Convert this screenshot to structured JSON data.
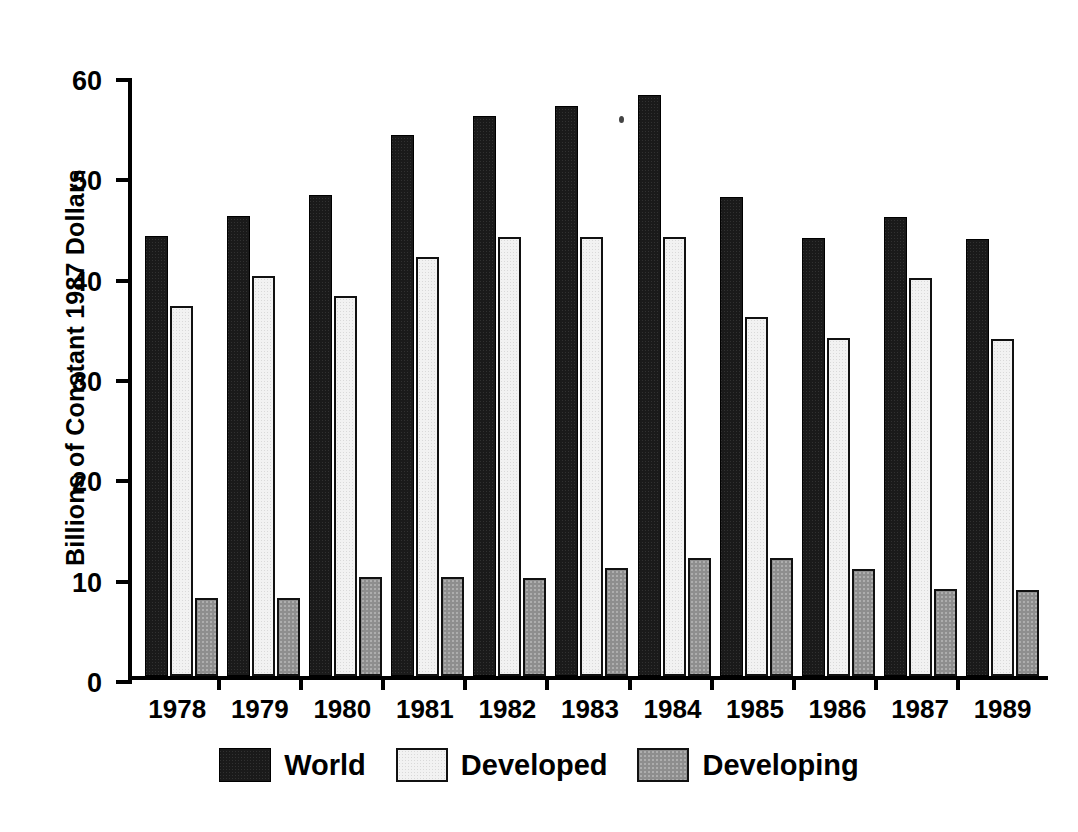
{
  "chart_data": {
    "type": "bar",
    "title": "",
    "xlabel": "",
    "ylabel": "Billions of Constant 1987 Dollars",
    "categories": [
      "1978",
      "1979",
      "1980",
      "1981",
      "1982",
      "1983",
      "1984",
      "1985",
      "1986",
      "1987",
      "1989"
    ],
    "series": [
      {
        "name": "World",
        "values": [
          43.9,
          45.8,
          47.9,
          53.9,
          55.8,
          56.8,
          57.9,
          47.7,
          43.7,
          45.7,
          43.6
        ]
      },
      {
        "name": "Developed",
        "values": [
          36.9,
          39.9,
          37.9,
          41.8,
          43.8,
          43.8,
          43.8,
          35.8,
          33.7,
          39.7,
          33.6
        ]
      },
      {
        "name": "Developing",
        "values": [
          7.8,
          7.8,
          9.9,
          9.9,
          9.8,
          10.8,
          11.8,
          11.8,
          10.7,
          8.7,
          8.6
        ]
      }
    ],
    "ylim": [
      0,
      60
    ],
    "yticks": [
      "0",
      "10",
      "20",
      "30",
      "40",
      "50",
      "60"
    ],
    "grid": false,
    "legend_position": "bottom"
  },
  "legend": {
    "items": [
      {
        "label": "World",
        "swatch": "dark-textured-swatch",
        "color": "#1a1a1a"
      },
      {
        "label": "Developed",
        "swatch": "white-outline-swatch",
        "color": "#f2f2f2"
      },
      {
        "label": "Developing",
        "swatch": "gray-textured-swatch",
        "color": "#8e8e8e"
      }
    ]
  }
}
